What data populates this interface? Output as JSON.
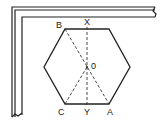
{
  "diagram": {
    "type": "geometry",
    "labels": {
      "B": "B",
      "X": "X",
      "O": "0",
      "C": "C",
      "Y": "Y",
      "A": "A"
    },
    "points": {
      "B": [
        65,
        29
      ],
      "X": [
        87,
        29
      ],
      "O": [
        87,
        67
      ],
      "C": [
        65,
        104
      ],
      "Y": [
        87,
        104
      ],
      "A": [
        109,
        104
      ]
    },
    "hexagon_vertices": [
      [
        65,
        29
      ],
      [
        109,
        29
      ],
      [
        130,
        67
      ],
      [
        109,
        104
      ],
      [
        65,
        104
      ],
      [
        44,
        67
      ]
    ],
    "dashed_lines": [
      [
        "X",
        "Y"
      ],
      [
        "B",
        "A"
      ],
      [
        "O",
        "C"
      ]
    ],
    "colors": {
      "stroke": "#222222",
      "background": "#ffffff"
    }
  }
}
